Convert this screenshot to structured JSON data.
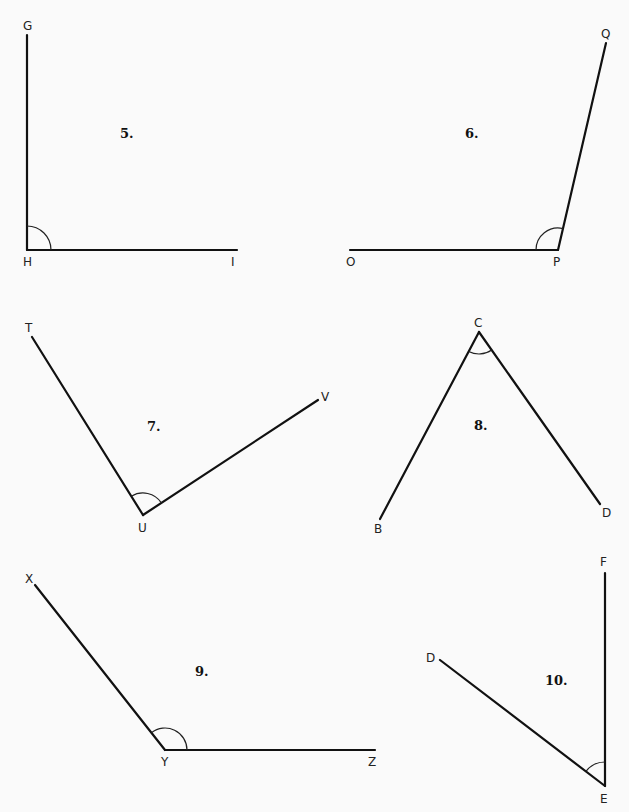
{
  "page": {
    "background": "#fafafa",
    "line_color": "#111111"
  },
  "problems": [
    {
      "number": "5.",
      "vertex": "H",
      "ends": [
        "G",
        "I"
      ],
      "points": {
        "G": [
          27,
          35
        ],
        "H": [
          27,
          250
        ],
        "I": [
          237,
          250
        ]
      },
      "labels": {
        "G": [
          23,
          30
        ],
        "H": [
          23,
          266
        ],
        "I": [
          231,
          266
        ]
      },
      "number_pos": [
        120,
        138
      ],
      "arc_radius": 24
    },
    {
      "number": "6.",
      "vertex": "P",
      "ends": [
        "O",
        "Q"
      ],
      "points": {
        "O": [
          350,
          250
        ],
        "P": [
          558,
          250
        ],
        "Q": [
          606,
          43
        ]
      },
      "labels": {
        "O": [
          346,
          266
        ],
        "P": [
          553,
          266
        ],
        "Q": [
          601,
          38
        ]
      },
      "number_pos": [
        465,
        138
      ],
      "arc_radius": 22
    },
    {
      "number": "7.",
      "vertex": "U",
      "ends": [
        "T",
        "V"
      ],
      "points": {
        "T": [
          32,
          337
        ],
        "U": [
          143,
          515
        ],
        "V": [
          318,
          400
        ]
      },
      "labels": {
        "T": [
          25,
          332
        ],
        "U": [
          138,
          532
        ],
        "V": [
          321,
          401
        ]
      },
      "number_pos": [
        147,
        431
      ],
      "arc_radius": 22
    },
    {
      "number": "8.",
      "vertex": "C",
      "ends": [
        "B",
        "D"
      ],
      "points": {
        "B": [
          380,
          519
        ],
        "C": [
          479,
          332
        ],
        "D": [
          600,
          504
        ]
      },
      "labels": {
        "B": [
          374,
          533
        ],
        "C": [
          474,
          327
        ],
        "D": [
          602,
          517
        ]
      },
      "number_pos": [
        474,
        430
      ],
      "arc_radius": 22
    },
    {
      "number": "9.",
      "vertex": "Y",
      "ends": [
        "X",
        "Z"
      ],
      "points": {
        "X": [
          35,
          585
        ],
        "Y": [
          165,
          750
        ],
        "Z": [
          375,
          750
        ]
      },
      "labels": {
        "X": [
          25,
          583
        ],
        "Y": [
          161,
          766
        ],
        "Z": [
          368,
          766
        ]
      },
      "number_pos": [
        195,
        676
      ],
      "arc_radius": 22
    },
    {
      "number": "10.",
      "vertex": "E",
      "ends": [
        "D",
        "F"
      ],
      "points": {
        "D": [
          440,
          660
        ],
        "E": [
          605,
          786
        ],
        "F": [
          605,
          573
        ]
      },
      "labels": {
        "D": [
          426,
          662
        ],
        "E": [
          600,
          803
        ],
        "F": [
          600,
          566
        ]
      },
      "number_pos": [
        545,
        685
      ],
      "arc_radius": 24
    }
  ]
}
